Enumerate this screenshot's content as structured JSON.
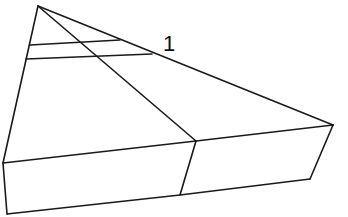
{
  "diagram": {
    "label": "1",
    "colors": {
      "stroke": "#1a1a1a",
      "background": "#ffffff"
    },
    "points": {
      "apex": [
        38,
        6
      ],
      "left_corner": [
        3,
        163
      ],
      "right_corner": [
        333,
        125
      ],
      "front_mid": [
        196,
        141
      ],
      "bottom_left": [
        7,
        214
      ],
      "bottom_mid": [
        180,
        195
      ],
      "bottom_right": [
        310,
        179
      ]
    }
  }
}
